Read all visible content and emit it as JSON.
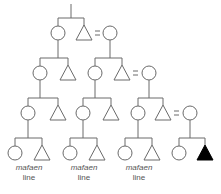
{
  "diagram": {
    "type": "kinship-chart",
    "stroke_color": "#6a6a6a",
    "fill_ego": "#000000",
    "marriage_symbol": "=",
    "generations": [
      {
        "level": 1,
        "members": [
          {
            "id": "g1f",
            "sex": "female",
            "x": 58
          },
          {
            "id": "g1m",
            "sex": "male",
            "x": 84
          },
          {
            "id": "g1w",
            "sex": "female",
            "x": 110,
            "spouse_of": "g1m"
          }
        ]
      },
      {
        "level": 2,
        "members": [
          {
            "id": "g2a",
            "sex": "female",
            "x": 40,
            "parent": "g1f"
          },
          {
            "id": "g2b",
            "sex": "male",
            "x": 68,
            "parent": "g1f"
          },
          {
            "id": "g2c",
            "sex": "female",
            "x": 95,
            "parent": "g1m"
          },
          {
            "id": "g2d",
            "sex": "male",
            "x": 122,
            "parent": "g1m"
          },
          {
            "id": "g2w",
            "sex": "female",
            "x": 149,
            "spouse_of": "g2d"
          }
        ]
      },
      {
        "level": 3,
        "members": [
          {
            "id": "g3a",
            "sex": "female",
            "x": 28
          },
          {
            "id": "g3b",
            "sex": "male",
            "x": 58
          },
          {
            "id": "g3c",
            "sex": "female",
            "x": 83
          },
          {
            "id": "g3d",
            "sex": "male",
            "x": 111
          },
          {
            "id": "g3e",
            "sex": "female",
            "x": 138
          },
          {
            "id": "g3f",
            "sex": "male",
            "x": 163
          },
          {
            "id": "g3w",
            "sex": "female",
            "x": 190,
            "spouse_of": "g3f"
          }
        ]
      },
      {
        "level": 4,
        "members": [
          {
            "id": "g4a",
            "sex": "female",
            "x": 15
          },
          {
            "id": "g4b",
            "sex": "male",
            "x": 42
          },
          {
            "id": "g4c",
            "sex": "female",
            "x": 70
          },
          {
            "id": "g4d",
            "sex": "male",
            "x": 97
          },
          {
            "id": "g4e",
            "sex": "female",
            "x": 125
          },
          {
            "id": "g4f",
            "sex": "male",
            "x": 152
          },
          {
            "id": "g4g",
            "sex": "female",
            "x": 179
          },
          {
            "id": "g4h",
            "sex": "male",
            "x": 205,
            "ego": true
          }
        ]
      }
    ],
    "labels": [
      {
        "line1": "mafaen",
        "line2": "line"
      },
      {
        "line1": "mafaen",
        "line2": "line"
      },
      {
        "line1": "mafaen",
        "line2": "line"
      }
    ]
  }
}
